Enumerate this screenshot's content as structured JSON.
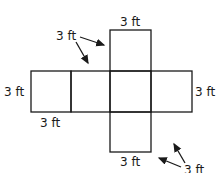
{
  "diagram": {
    "unit_label": "3 ft",
    "labels": {
      "top": "3 ft",
      "top_left_pointer": "3 ft",
      "left": "3 ft",
      "right": "3 ft",
      "below_left": "3 ft",
      "bottom_right_pointer": "3 ft",
      "bottom": "3 ft"
    },
    "squares": 6,
    "stroke_color": "#1a1a1a"
  }
}
